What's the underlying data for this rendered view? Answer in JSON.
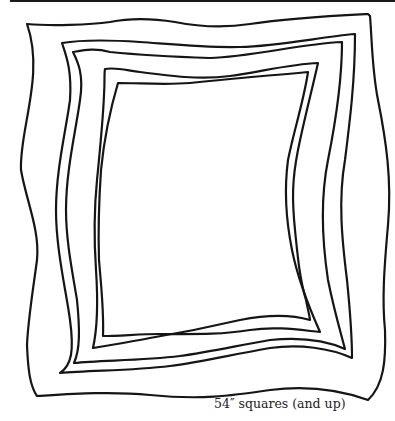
{
  "figure": {
    "frame_count": 5,
    "caption": "54″ squares (and up)"
  }
}
